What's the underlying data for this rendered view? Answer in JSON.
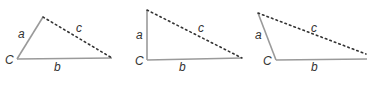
{
  "colors": {
    "solid_side": "#9a9a9a",
    "dashed_side": "#333333",
    "label": "#333333",
    "background": "#ffffff"
  },
  "triangles": [
    {
      "name": "acute-triangle",
      "vertex_C": [
        17,
        59
      ],
      "vertex_top": [
        43,
        17
      ],
      "vertex_right": [
        112,
        58
      ],
      "labels": {
        "C": "C",
        "a": "a",
        "b": "b",
        "c": "c"
      }
    },
    {
      "name": "right-triangle",
      "vertex_C": [
        147,
        60
      ],
      "vertex_top": [
        147,
        10
      ],
      "vertex_right": [
        242,
        58
      ],
      "labels": {
        "C": "C",
        "a": "a",
        "b": "b",
        "c": "c"
      }
    },
    {
      "name": "obtuse-triangle",
      "vertex_C": [
        276,
        60
      ],
      "vertex_top": [
        258,
        13
      ],
      "vertex_right": [
        367,
        58
      ],
      "labels": {
        "C": "C",
        "a": "a",
        "b": "b",
        "c": "c"
      }
    }
  ]
}
